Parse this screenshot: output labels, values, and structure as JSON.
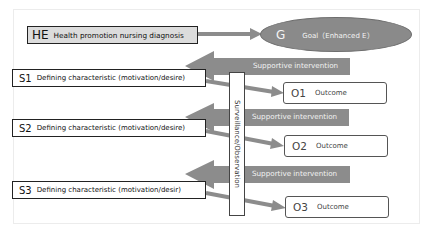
{
  "diagram": {
    "health_promotion": {
      "code": "HE",
      "label": "Health promotion nursing diagnosis"
    },
    "goal": {
      "code": "G",
      "label": "Goal（Enhanced E）"
    },
    "surveillance": {
      "label": "Surveillance/Observation"
    },
    "rows": [
      {
        "characteristic": {
          "code": "S1",
          "label": "Defining characteristic (motivation/desire)"
        },
        "intervention": {
          "label": "Supportive intervention"
        },
        "outcome": {
          "code": "O1",
          "label": "Outcome"
        }
      },
      {
        "characteristic": {
          "code": "S2",
          "label": "Defining characteristic (motivation/desire)"
        },
        "intervention": {
          "label": "Supportive intervention"
        },
        "outcome": {
          "code": "O2",
          "label": "Outcome"
        }
      },
      {
        "characteristic": {
          "code": "S3",
          "label": "Defining characteristic (motivation/desir)"
        },
        "intervention": {
          "label": "Supportive intervention"
        },
        "outcome": {
          "code": "O3",
          "label": "Outcome"
        }
      }
    ],
    "colors": {
      "arrow_fill": "#8c8c8c",
      "goal_fill": "#8a8a8a",
      "he_fill": "#dcdcdc",
      "border_dark": "#222222"
    }
  }
}
